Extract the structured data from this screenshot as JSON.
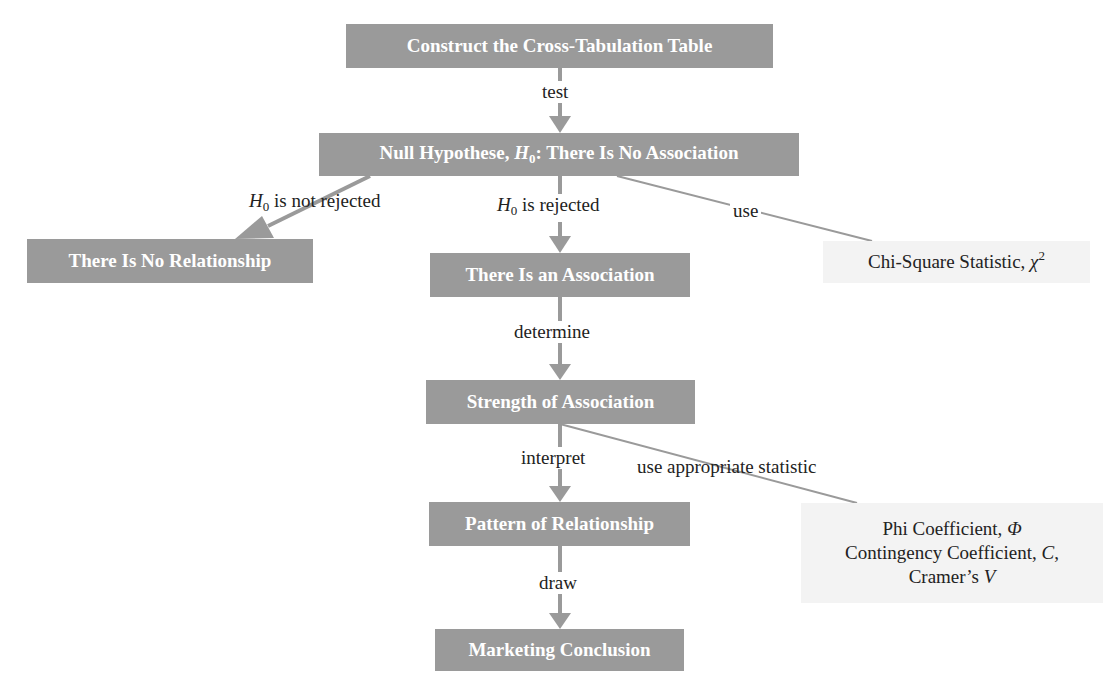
{
  "diagram": {
    "colors": {
      "node_fill": "#9a9a9a",
      "node_text": "#ffffff",
      "stat_fill": "#f3f3f3",
      "edge": "#9a9a9a",
      "label_text": "#222222"
    },
    "nodes": {
      "construct": {
        "label": "Construct the Cross-Tabulation Table"
      },
      "null_hypothesis": {
        "label_prefix": "Null Hypothese, ",
        "symbol": "H",
        "subscript": "0",
        "label_suffix": ": There Is No Association"
      },
      "no_relationship": {
        "label": "There Is No Relationship"
      },
      "association": {
        "label": "There Is an Association"
      },
      "strength": {
        "label": "Strength of Association"
      },
      "pattern": {
        "label": "Pattern of Relationship"
      },
      "conclusion": {
        "label": "Marketing Conclusion"
      },
      "chi_square": {
        "label": "Chi-Square Statistic, ",
        "symbol": "χ",
        "superscript": "2"
      },
      "coefficients": {
        "line1_text": "Phi Coefficient, ",
        "line1_symbol": "Φ",
        "line2_text": "Contingency Coefficient, ",
        "line2_symbol": "C",
        "line2_suffix": ",",
        "line3_text": "Cramer’s ",
        "line3_symbol": "V"
      }
    },
    "edges": {
      "test": {
        "label": "test"
      },
      "not_rejected": {
        "symbol": "H",
        "subscript": "0",
        "label": " is not rejected"
      },
      "rejected": {
        "symbol": "H",
        "subscript": "0",
        "label": " is rejected"
      },
      "use": {
        "label": "use"
      },
      "determine": {
        "label": "determine"
      },
      "interpret": {
        "label": "interpret"
      },
      "use_appropriate": {
        "label": "use appropriate statistic"
      },
      "draw": {
        "label": "draw"
      }
    }
  }
}
